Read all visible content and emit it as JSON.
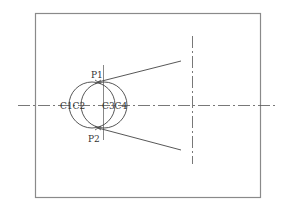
{
  "diagram": {
    "frame": {
      "x": 35.5,
      "y": 13.5,
      "width": 225,
      "height": 184,
      "color": "#8a8a8a"
    },
    "stroke_color": "#444444",
    "centerline_color": "#555555",
    "labels": {
      "p1": "P1",
      "p2": "P2",
      "c1c2": "C1C2",
      "c3c4": "C3C4"
    },
    "label_positions": {
      "p1": {
        "x": 91,
        "y": 78
      },
      "p2": {
        "x": 88,
        "y": 142
      },
      "c1c2": {
        "x": 60,
        "y": 109
      },
      "c3c4": {
        "x": 102,
        "y": 109
      }
    },
    "horizontal_centerline": {
      "x1": 18,
      "y1": 105.5,
      "x2": 275,
      "y2": 105.5
    },
    "short_vertical_line": {
      "x1": 103.5,
      "y1": 65,
      "x2": 103.5,
      "y2": 140
    },
    "right_vertical_centerline": {
      "x1": 192.5,
      "y1": 36,
      "x2": 192.5,
      "y2": 164
    },
    "circles": [
      {
        "name": "left-circle",
        "cx": 92,
        "cy": 105,
        "r": 23
      },
      {
        "name": "right-circle",
        "cx": 104,
        "cy": 105,
        "r": 23
      }
    ],
    "points": {
      "p1": {
        "x": 98,
        "y": 82
      },
      "p2": {
        "x": 98,
        "y": 128
      }
    },
    "tangent_lines": [
      {
        "name": "upper-line",
        "x1": 98,
        "y1": 82,
        "x2": 181,
        "y2": 61
      },
      {
        "name": "lower-line",
        "x1": 98,
        "y1": 128,
        "x2": 181,
        "y2": 150
      }
    ]
  }
}
